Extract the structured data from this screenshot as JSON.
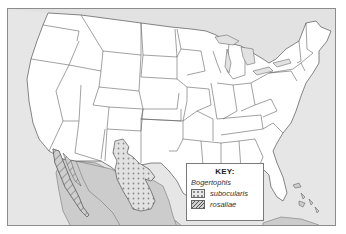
{
  "map": {
    "subject": "Distribution of Bogertophis",
    "region": "United States and northern Mexico",
    "colors": {
      "water": "#e6e6e6",
      "us_land": "#ffffff",
      "mexico_land": "#cccccc",
      "range_fill": "#e2e2e2",
      "border": "#8c8c8c"
    }
  },
  "key": {
    "title": "KEY:",
    "genus": "Bogertophis",
    "entries": [
      {
        "label": "subocularis",
        "pattern": "dots"
      },
      {
        "label": "rosaliae",
        "pattern": "hatch"
      }
    ]
  }
}
